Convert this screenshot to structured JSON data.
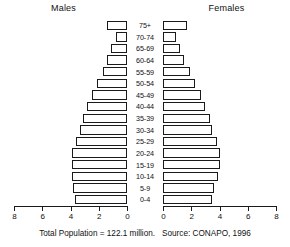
{
  "headers": {
    "males": "Males",
    "females": "Females"
  },
  "footer": {
    "total_population": "Total Population = 122.1 million.",
    "source": "Source: CONAPO, 1996"
  },
  "axis": {
    "tick_labels_male": [
      "8",
      "6",
      "4",
      "2",
      "0"
    ],
    "tick_labels_female": [
      "0",
      "2",
      "4",
      "6",
      "8"
    ],
    "max": 8,
    "unit": "millions"
  },
  "chart_data": {
    "type": "bar",
    "subtitle": "Total Population = 122.1 million.",
    "annotation": "Source: CONAPO, 1996",
    "orientation": "horizontal",
    "layout": "population-pyramid",
    "xlabel": "",
    "ylabel": "",
    "xlim": [
      0,
      8
    ],
    "grid": false,
    "legend": "none",
    "categories": [
      "75+",
      "70-74",
      "65-69",
      "60-64",
      "55-59",
      "50-54",
      "45-49",
      "40-44",
      "35-39",
      "30-34",
      "25-29",
      "20-24",
      "15-19",
      "10-14",
      "5-9",
      "0-4"
    ],
    "series": [
      {
        "name": "Males",
        "side": "left",
        "values": [
          1.4,
          0.8,
          1.1,
          1.4,
          1.7,
          2.1,
          2.5,
          2.8,
          3.1,
          3.3,
          3.6,
          3.9,
          3.9,
          3.9,
          3.8,
          3.7
        ]
      },
      {
        "name": "Females",
        "side": "right",
        "values": [
          1.7,
          0.9,
          1.2,
          1.5,
          1.9,
          2.3,
          2.7,
          3.0,
          3.3,
          3.5,
          3.8,
          4.0,
          4.0,
          3.9,
          3.6,
          3.5
        ]
      }
    ]
  }
}
